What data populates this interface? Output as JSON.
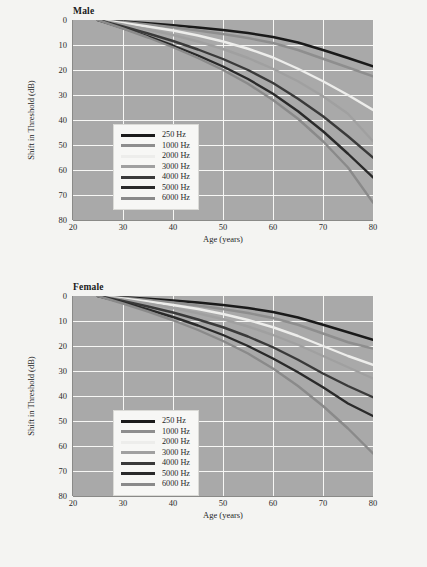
{
  "figure": {
    "background": "#f4f4f2",
    "plot_background": "#a9a9a9",
    "gridline_color": "#f7f7f5"
  },
  "panels": [
    {
      "key": "male",
      "title": "Male"
    },
    {
      "key": "female",
      "title": "Female"
    }
  ],
  "axis": {
    "xlabel": "Age (years)",
    "ylabel": "Shift in Threshold (dB)",
    "xticks": [
      "20",
      "30",
      "40",
      "50",
      "60",
      "70",
      "80"
    ],
    "yticks": [
      "0",
      "10",
      "20",
      "30",
      "40",
      "50",
      "60",
      "70",
      "80"
    ]
  },
  "legend": {
    "entries": [
      {
        "label": "250 Hz",
        "color": "#1a1a1a"
      },
      {
        "label": "1000 Hz",
        "color": "#8e8e8e"
      },
      {
        "label": "2000 Hz",
        "color": "#ededeb"
      },
      {
        "label": "3000 Hz",
        "color": "#a0a0a0"
      },
      {
        "label": "4000 Hz",
        "color": "#3a3a3a"
      },
      {
        "label": "5000 Hz",
        "color": "#2a2a2a"
      },
      {
        "label": "6000 Hz",
        "color": "#8a8a8a"
      }
    ]
  },
  "chart_data": {
    "type": "line",
    "xlabel": "Age (years)",
    "ylabel": "Shift in Threshold (dB)",
    "xlim": [
      20,
      80
    ],
    "ylim": [
      0,
      80
    ],
    "y_axis_inverted": true,
    "grid": true,
    "legend_position": "inside-left",
    "x": [
      25,
      30,
      35,
      40,
      45,
      50,
      55,
      60,
      65,
      70,
      75,
      80
    ],
    "panels": [
      {
        "name": "Male",
        "series": [
          {
            "name": "250 Hz",
            "color": "#1a1a1a",
            "values": [
              0,
              0.6,
              1.3,
              2.1,
              3.0,
              4.0,
              5.2,
              6.8,
              9.0,
              12.0,
              15.2,
              18.5
            ]
          },
          {
            "name": "1000 Hz",
            "color": "#8e8e8e",
            "values": [
              0,
              0.8,
              1.8,
              2.9,
              4.2,
              5.6,
              7.2,
              9.2,
              12.0,
              15.5,
              19.0,
              22.5
            ]
          },
          {
            "name": "2000 Hz",
            "color": "#ededeb",
            "values": [
              0,
              1.2,
              2.6,
              4.2,
              6.2,
              8.6,
              11.5,
              15.0,
              19.5,
              24.5,
              30.0,
              36.0
            ]
          },
          {
            "name": "3000 Hz",
            "color": "#a0a0a0",
            "values": [
              0,
              1.8,
              3.8,
              6.0,
              8.6,
              11.6,
              15.2,
              19.5,
              24.5,
              30.5,
              37.5,
              48.5
            ]
          },
          {
            "name": "4000 Hz",
            "color": "#3a3a3a",
            "values": [
              0,
              2.6,
              5.4,
              8.4,
              11.8,
              15.6,
              20.0,
              25.2,
              31.5,
              38.5,
              46.5,
              55.0
            ]
          },
          {
            "name": "5000 Hz",
            "color": "#2a2a2a",
            "values": [
              0,
              3.2,
              6.6,
              10.2,
              14.2,
              18.6,
              23.6,
              29.5,
              36.5,
              44.5,
              53.5,
              63.0
            ]
          },
          {
            "name": "6000 Hz",
            "color": "#8a8a8a",
            "values": [
              0,
              3.4,
              7.0,
              10.9,
              15.2,
              20.0,
              25.5,
              32.0,
              39.5,
              48.5,
              59.0,
              73.0
            ]
          }
        ]
      },
      {
        "name": "Female",
        "series": [
          {
            "name": "250 Hz",
            "color": "#1a1a1a",
            "values": [
              0,
              0.5,
              1.1,
              1.8,
              2.6,
              3.6,
              4.8,
              6.4,
              8.6,
              11.5,
              14.5,
              17.5
            ]
          },
          {
            "name": "1000 Hz",
            "color": "#8e8e8e",
            "values": [
              0,
              0.7,
              1.6,
              2.6,
              3.8,
              5.2,
              6.8,
              8.8,
              11.5,
              15.0,
              18.5,
              21.0
            ]
          },
          {
            "name": "2000 Hz",
            "color": "#ededeb",
            "values": [
              0,
              1.0,
              2.2,
              3.6,
              5.2,
              7.2,
              9.6,
              12.5,
              16.0,
              20.0,
              24.0,
              27.5
            ]
          },
          {
            "name": "3000 Hz",
            "color": "#a0a0a0",
            "values": [
              0,
              1.4,
              3.0,
              4.8,
              6.9,
              9.3,
              12.2,
              15.6,
              19.5,
              24.0,
              28.5,
              33.0
            ]
          },
          {
            "name": "4000 Hz",
            "color": "#3a3a3a",
            "values": [
              0,
              2.0,
              4.2,
              6.6,
              9.4,
              12.5,
              16.2,
              20.5,
              25.5,
              31.0,
              36.0,
              40.5
            ]
          },
          {
            "name": "5000 Hz",
            "color": "#2a2a2a",
            "values": [
              0,
              2.6,
              5.4,
              8.4,
              11.8,
              15.6,
              20.0,
              25.0,
              30.5,
              36.5,
              43.0,
              48.0
            ]
          },
          {
            "name": "6000 Hz",
            "color": "#8a8a8a",
            "values": [
              0,
              3.0,
              6.2,
              9.7,
              13.6,
              18.0,
              23.0,
              29.0,
              36.0,
              44.0,
              53.0,
              63.0
            ]
          }
        ]
      }
    ]
  }
}
